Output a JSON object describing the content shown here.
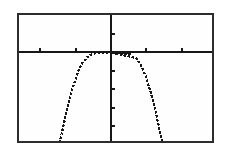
{
  "page": {
    "background_color": "#ffffff"
  },
  "screen": {
    "border_color": "#2d2d2d",
    "background_color": "#fefefe",
    "ink_color": "#171717"
  },
  "chart_data": {
    "type": "line",
    "title": "",
    "xlabel": "",
    "ylabel": "",
    "xlim": [
      -2.6,
      2.85
    ],
    "ylim": [
      -4.8,
      2.0
    ],
    "xscl": 1,
    "yscl": 1,
    "x_ticks": [
      -2,
      -1,
      1,
      2
    ],
    "y_ticks": [
      1,
      -1,
      -2,
      -3,
      -4
    ],
    "grid": false,
    "legend": false,
    "axes_style": "calculator axes: x-ticks as nubs above the x-axis, y-ticks as nubs right of the y-axis",
    "series": [
      {
        "name": "curve",
        "points": [
          [
            -1.46,
            -4.9
          ],
          [
            -1.4,
            -4.45
          ],
          [
            -1.33,
            -3.85
          ],
          [
            -1.26,
            -3.2
          ],
          [
            -1.18,
            -2.6
          ],
          [
            -1.1,
            -2.05
          ],
          [
            -1.0,
            -1.45
          ],
          [
            -0.92,
            -1.0
          ],
          [
            -0.82,
            -0.62
          ],
          [
            -0.7,
            -0.32
          ],
          [
            -0.55,
            -0.12
          ],
          [
            -0.4,
            -0.03
          ],
          [
            0,
            -0.02
          ],
          [
            0.4,
            -0.03
          ],
          [
            0.55,
            -0.12
          ],
          [
            -0.0,
            -0.02
          ],
          [
            0.7,
            -0.32
          ],
          [
            0.82,
            -0.62
          ],
          [
            0.92,
            -1.0
          ],
          [
            1.0,
            -1.45
          ],
          [
            1.1,
            -2.05
          ],
          [
            1.18,
            -2.6
          ],
          [
            1.26,
            -3.2
          ],
          [
            1.33,
            -3.85
          ],
          [
            1.4,
            -4.45
          ],
          [
            1.46,
            -4.9
          ]
        ]
      }
    ]
  }
}
